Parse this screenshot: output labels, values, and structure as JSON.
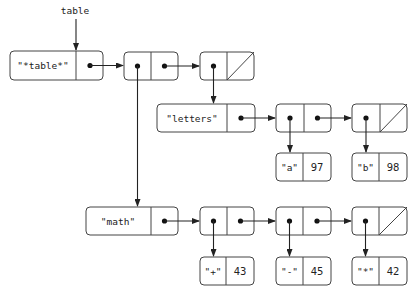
{
  "diagram": {
    "title_label": "table",
    "nodes": {
      "table_head": {
        "car": "\"*table*\""
      },
      "letters_head": {
        "car": "\"letters\""
      },
      "math_head": {
        "car": "\"math\""
      },
      "rec_a": {
        "key": "\"a\"",
        "value": "97"
      },
      "rec_b": {
        "key": "\"b\"",
        "value": "98"
      },
      "rec_plus": {
        "key": "\"+\"",
        "value": "43"
      },
      "rec_minus": {
        "key": "\"-\"",
        "value": "45"
      },
      "rec_star": {
        "key": "\"*\"",
        "value": "42"
      }
    },
    "colors": {
      "stroke": "#444444",
      "arrow": "#222222",
      "background": "#ffffff"
    }
  }
}
